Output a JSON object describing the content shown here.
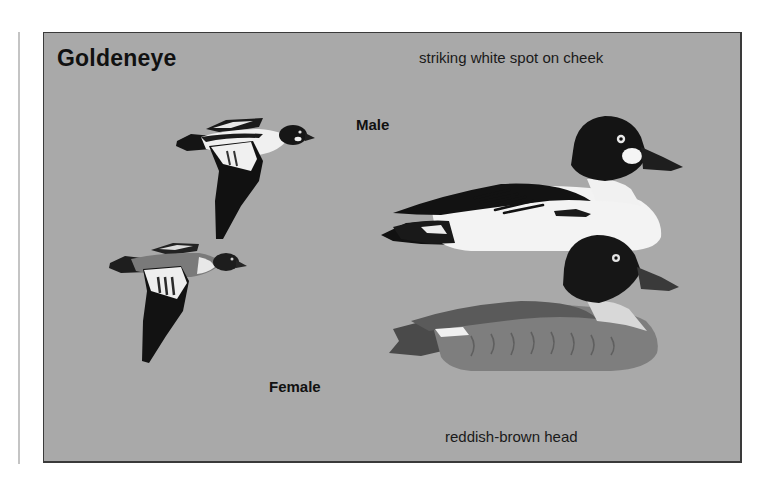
{
  "plate": {
    "title": "Goldeneye",
    "captions": {
      "top": "striking white spot on cheek",
      "bottom": "reddish-brown head"
    },
    "labels": {
      "male": "Male",
      "female": "Female"
    },
    "colors": {
      "background": "#a9a9a9",
      "border": "#3a3a3a",
      "male_head": "#151515",
      "male_body": "#f2f2f2",
      "female_head": "#1c1c1c",
      "female_body": "#7d7d7d",
      "cheek_spot": "#f5f5f5"
    },
    "illustrations": [
      {
        "id": "male-flying",
        "pose": "flying"
      },
      {
        "id": "female-flying",
        "pose": "flying"
      },
      {
        "id": "male-swimming",
        "pose": "swimming"
      },
      {
        "id": "female-swimming",
        "pose": "swimming"
      }
    ]
  }
}
